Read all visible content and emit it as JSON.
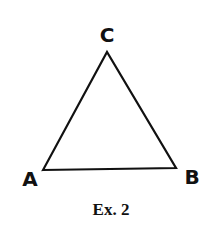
{
  "diagram": {
    "type": "triangle",
    "vertices": [
      {
        "label": "A",
        "x": 43,
        "y": 170
      },
      {
        "label": "B",
        "x": 176,
        "y": 168
      },
      {
        "label": "C",
        "x": 107,
        "y": 52
      }
    ],
    "labels": {
      "a": "A",
      "b": "B",
      "c": "C"
    },
    "caption": "Ex. 2",
    "stroke_color": "#111111",
    "background_color": "#ffffff"
  }
}
